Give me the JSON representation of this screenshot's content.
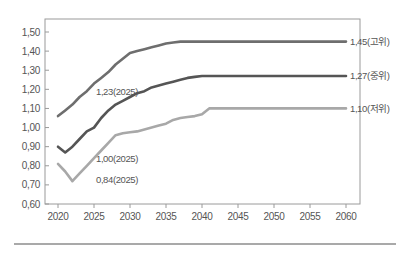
{
  "chart_data": {
    "type": "line",
    "title": "",
    "xlabel": "",
    "ylabel": "",
    "xlim": [
      2020,
      2060
    ],
    "ylim": [
      0.6,
      1.55
    ],
    "grid": false,
    "legend": "none (end-of-line labels)",
    "x_ticks": [
      "2020",
      "2025",
      "2030",
      "2035",
      "2040",
      "2045",
      "2050",
      "2055",
      "2060"
    ],
    "y_ticks": [
      "0,60",
      "0,70",
      "0,80",
      "0,90",
      "1,00",
      "1,10",
      "1,20",
      "1,30",
      "1,40",
      "1,50"
    ],
    "series": [
      {
        "name": "고위",
        "color": "#6e6e6e",
        "end_label": "1,45(고위)",
        "annotation": "1,23(2025)",
        "x": [
          2020,
          2021,
          2022,
          2023,
          2024,
          2025,
          2026,
          2027,
          2028,
          2029,
          2030,
          2031,
          2032,
          2033,
          2034,
          2035,
          2036,
          2037,
          2038,
          2040,
          2045,
          2050,
          2055,
          2060
        ],
        "values": [
          1.06,
          1.09,
          1.12,
          1.16,
          1.19,
          1.23,
          1.26,
          1.29,
          1.33,
          1.36,
          1.39,
          1.4,
          1.41,
          1.42,
          1.43,
          1.44,
          1.445,
          1.45,
          1.45,
          1.45,
          1.45,
          1.45,
          1.45,
          1.45
        ]
      },
      {
        "name": "중위",
        "color": "#555555",
        "end_label": "1,27(중위)",
        "annotation": "1,00(2025)",
        "x": [
          2020,
          2021,
          2022,
          2023,
          2024,
          2025,
          2026,
          2027,
          2028,
          2029,
          2030,
          2031,
          2032,
          2033,
          2034,
          2035,
          2036,
          2037,
          2038,
          2039,
          2040,
          2045,
          2050,
          2055,
          2060
        ],
        "values": [
          0.9,
          0.87,
          0.9,
          0.94,
          0.98,
          1.0,
          1.05,
          1.09,
          1.12,
          1.14,
          1.16,
          1.18,
          1.19,
          1.21,
          1.22,
          1.23,
          1.24,
          1.25,
          1.26,
          1.265,
          1.27,
          1.27,
          1.27,
          1.27,
          1.27
        ]
      },
      {
        "name": "저위",
        "color": "#a8a8a8",
        "end_label": "1,10(저위)",
        "annotation": "0,84(2025)",
        "x": [
          2020,
          2021,
          2022,
          2023,
          2024,
          2025,
          2026,
          2027,
          2028,
          2029,
          2030,
          2031,
          2032,
          2033,
          2034,
          2035,
          2036,
          2037,
          2038,
          2039,
          2040,
          2041,
          2045,
          2050,
          2055,
          2060
        ],
        "values": [
          0.81,
          0.77,
          0.72,
          0.76,
          0.8,
          0.84,
          0.88,
          0.92,
          0.96,
          0.97,
          0.975,
          0.98,
          0.99,
          1.0,
          1.01,
          1.02,
          1.04,
          1.05,
          1.055,
          1.06,
          1.07,
          1.1,
          1.1,
          1.1,
          1.1,
          1.1
        ]
      }
    ]
  }
}
